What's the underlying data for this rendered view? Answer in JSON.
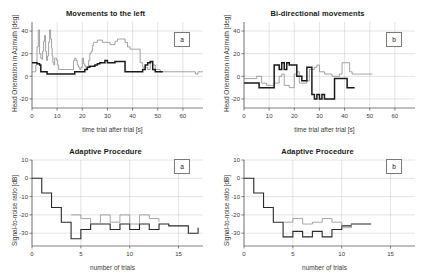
{
  "figure": {
    "background": "#ffffff",
    "line_color_primary": "#1a1a1a",
    "line_color_secondary": "#8c8c8c"
  },
  "panels": {
    "top_left": {
      "badge": "a"
    },
    "top_right": {
      "badge": "b"
    },
    "bottom_left": {
      "badge": "a"
    },
    "bottom_right": {
      "badge": "b"
    }
  },
  "chart_data": [
    {
      "id": "top_left",
      "type": "line",
      "title": "Movements to the left",
      "xlabel": "time trial after trial [s]",
      "ylabel": "Head Orientation in Azimuth [deg]",
      "xlim": [
        0,
        68
      ],
      "ylim": [
        -28,
        48
      ],
      "xticks": [
        0,
        10,
        20,
        30,
        40,
        50,
        60
      ],
      "yticks": [
        -20,
        0,
        20,
        40
      ],
      "grid": true,
      "legend": "none",
      "series": [
        {
          "name": "trace-thin",
          "color": "#8c8c8c",
          "x": [
            0,
            1,
            1.5,
            2,
            2.5,
            3,
            3.5,
            4,
            4.2,
            4.6,
            5,
            5.4,
            5.8,
            6.2,
            6.6,
            7,
            7.4,
            7.8,
            8,
            8.3,
            8.7,
            9,
            9.4,
            9.8,
            10.2,
            10.6,
            11,
            12,
            13,
            14,
            15,
            16,
            16.5,
            17,
            17.5,
            18,
            18.5,
            19,
            19.5,
            20,
            20.5,
            21,
            21.5,
            22,
            22.5,
            23,
            23.5,
            24,
            24.5,
            25,
            26,
            27,
            28,
            29,
            30,
            31,
            32,
            33,
            34,
            35,
            36,
            37,
            38,
            39,
            40,
            41,
            42,
            43,
            44,
            45,
            46,
            47,
            48,
            49,
            50,
            51,
            52,
            60,
            62,
            63,
            64,
            65,
            66,
            67,
            68
          ],
          "y": [
            4,
            4,
            10,
            26,
            41,
            20,
            16,
            15,
            22,
            31,
            36,
            22,
            14,
            18,
            30,
            41,
            33,
            25,
            18,
            12,
            10,
            16,
            16,
            14,
            10,
            6,
            6,
            6,
            6,
            6,
            6,
            6,
            14,
            16,
            14,
            10,
            8,
            6,
            8,
            16,
            11,
            9,
            7,
            8,
            14,
            20,
            22,
            27,
            30,
            30,
            32,
            32,
            30,
            30,
            30,
            28,
            28,
            31,
            33,
            33,
            33,
            30,
            26,
            24,
            24,
            24,
            24,
            12,
            8,
            8,
            6,
            12,
            10,
            6,
            6,
            4,
            4,
            4,
            4,
            4,
            4,
            2,
            4,
            4,
            4
          ]
        },
        {
          "name": "trace-thick",
          "color": "#1a1a1a",
          "x": [
            0,
            1,
            2,
            3,
            3.5,
            4,
            5,
            6,
            7,
            8,
            9,
            10,
            11,
            12,
            13,
            14,
            15,
            16,
            17,
            18,
            19,
            20,
            21,
            22,
            23,
            24,
            25,
            26,
            27,
            28,
            29,
            30,
            31,
            32,
            33,
            34,
            35,
            36,
            37,
            38,
            39,
            40,
            41,
            42,
            43,
            44,
            45,
            46,
            47,
            48,
            49,
            50,
            51,
            52
          ],
          "y": [
            12,
            12,
            11,
            10,
            4,
            4,
            4,
            2,
            2,
            2,
            2,
            2,
            2,
            2,
            2,
            2,
            2,
            2,
            4,
            4,
            4,
            4,
            6,
            8,
            9,
            9,
            10,
            11,
            12,
            12,
            14,
            12,
            12,
            12,
            13,
            13,
            13,
            13,
            4,
            4,
            4,
            4,
            4,
            4,
            4,
            6,
            10,
            12,
            13,
            6,
            4,
            4,
            4,
            4
          ]
        }
      ]
    },
    {
      "id": "top_right",
      "type": "line",
      "title": "Bi-directional movements",
      "xlabel": "time trial after trial [s]",
      "ylabel": "Head Orientation in Azimuth [deg]",
      "xlim": [
        0,
        68
      ],
      "ylim": [
        -28,
        48
      ],
      "xticks": [
        0,
        10,
        20,
        30,
        40,
        50,
        60
      ],
      "yticks": [
        -20,
        0,
        20,
        40
      ],
      "grid": true,
      "legend": "none",
      "series": [
        {
          "name": "trace-thin",
          "color": "#8c8c8c",
          "x": [
            0,
            2,
            4,
            5,
            6,
            7,
            8,
            9,
            10,
            11,
            12,
            13,
            14,
            15,
            16,
            17,
            18,
            19,
            20,
            21,
            22,
            23,
            24,
            25,
            26,
            27,
            28,
            29,
            30,
            31,
            32,
            33,
            34,
            35,
            36,
            37,
            38,
            39,
            40,
            41,
            42,
            43,
            44,
            45,
            46,
            47,
            48,
            49,
            50,
            51
          ],
          "y": [
            -2,
            -2,
            -2,
            0,
            0,
            -6,
            -6,
            -8,
            -8,
            -8,
            -6,
            -6,
            0,
            2,
            -8,
            -8,
            -10,
            -10,
            2,
            4,
            -6,
            -6,
            -6,
            -4,
            6,
            6,
            8,
            10,
            4,
            4,
            2,
            2,
            2,
            0,
            0,
            0,
            2,
            12,
            12,
            12,
            4,
            2,
            2,
            2,
            2,
            2,
            2,
            2,
            2,
            2
          ]
        },
        {
          "name": "trace-thick",
          "color": "#1a1a1a",
          "x": [
            0,
            1,
            2,
            3,
            4,
            5,
            6,
            7,
            8,
            9,
            10,
            11,
            12,
            13,
            14,
            15,
            16,
            17,
            18,
            19,
            20,
            21,
            22,
            23,
            24,
            25,
            26,
            27,
            28,
            29,
            30,
            31,
            32,
            33,
            34,
            35,
            36,
            37,
            38,
            39,
            40,
            41,
            42,
            43,
            44
          ],
          "y": [
            -6,
            -6,
            -6,
            -6,
            -6,
            -6,
            -10,
            -10,
            -10,
            -10,
            -10,
            -10,
            10,
            10,
            6,
            12,
            6,
            12,
            10,
            10,
            10,
            0,
            0,
            -4,
            -4,
            8,
            8,
            -16,
            -20,
            -16,
            -20,
            -16,
            -20,
            -20,
            -20,
            -20,
            -2,
            -2,
            -2,
            -2,
            -2,
            -10,
            -10,
            -10,
            -10
          ]
        }
      ]
    },
    {
      "id": "bottom_left",
      "type": "line",
      "title": "Adaptive Procedure",
      "xlabel": "number of trials",
      "ylabel": "Signal-to-noise ratio [dB]",
      "xlim": [
        0,
        17.5
      ],
      "ylim": [
        -37,
        10
      ],
      "xticks": [
        0,
        5,
        10,
        15
      ],
      "yticks": [
        -30,
        -20,
        -10,
        0,
        10
      ],
      "grid": true,
      "legend": "none",
      "series": [
        {
          "name": "staircase-thick",
          "color": "#2a2a2a",
          "x": [
            0,
            1,
            2,
            3,
            4,
            4.5,
            5,
            6,
            7,
            8,
            9,
            10,
            11,
            12,
            13,
            14,
            15,
            16,
            17
          ],
          "y": [
            0,
            -8,
            -16,
            -24,
            -33,
            -33,
            -28,
            -25,
            -25,
            -28,
            -25,
            -28,
            -25,
            -28,
            -25,
            -26,
            -26,
            -30,
            -27
          ]
        },
        {
          "name": "staircase-thin",
          "color": "#909090",
          "x": [
            4,
            5,
            6,
            7,
            8,
            9,
            10,
            11,
            12,
            13
          ],
          "y": [
            -20,
            -22,
            -25,
            -20,
            -24,
            -20,
            -25,
            -20,
            -22,
            -24
          ]
        }
      ]
    },
    {
      "id": "bottom_right",
      "type": "line",
      "title": "Adaptive Procedure",
      "xlabel": "number of trials",
      "ylabel": "Signal-to-noise ratio [dB]",
      "xlim": [
        0,
        17.5
      ],
      "ylim": [
        -37,
        10
      ],
      "xticks": [
        0,
        5,
        10,
        15
      ],
      "yticks": [
        -30,
        -20,
        -10,
        0,
        10
      ],
      "grid": true,
      "legend": "none",
      "series": [
        {
          "name": "staircase-thick",
          "color": "#2a2a2a",
          "x": [
            0,
            1,
            2,
            3,
            4,
            5,
            6,
            7,
            8,
            9,
            10,
            11,
            12,
            13
          ],
          "y": [
            0,
            -8,
            -16,
            -24,
            -32,
            -29,
            -32,
            -29,
            -32,
            -28,
            -26,
            -25,
            -25,
            -25
          ]
        },
        {
          "name": "staircase-thin",
          "color": "#909090",
          "x": [
            4,
            5,
            6,
            7,
            8,
            9,
            10,
            11,
            12,
            13
          ],
          "y": [
            -24,
            -22,
            -25,
            -24,
            -22,
            -24,
            -27,
            -25,
            -25,
            -25
          ]
        }
      ]
    }
  ]
}
